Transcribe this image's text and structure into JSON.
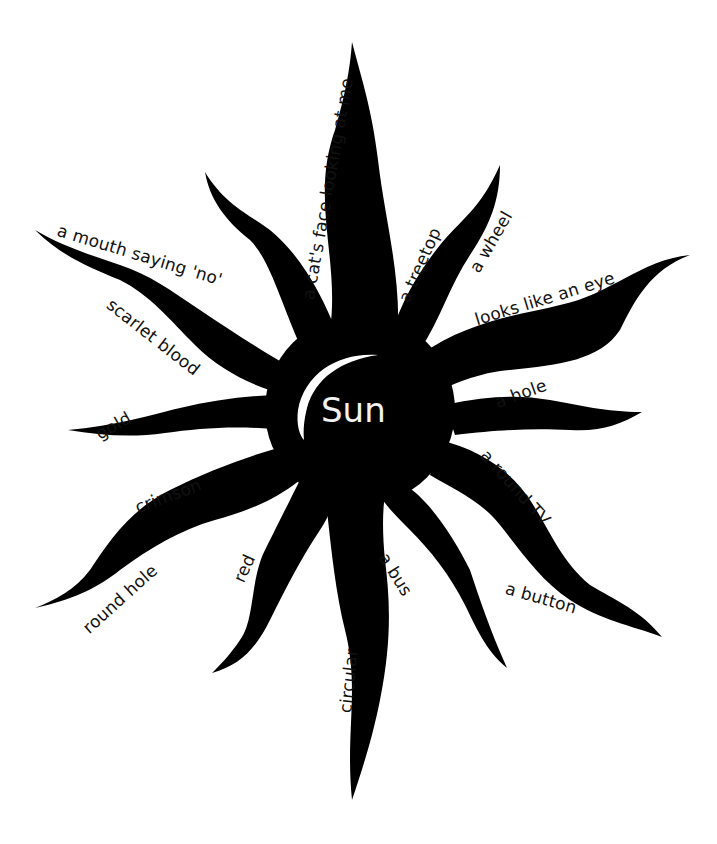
{
  "diagram": {
    "center": {
      "label": "Sun",
      "fill": "#000000",
      "text_color": "#f2f2f2"
    },
    "rays": [
      {
        "id": "top",
        "label": "a cat's face looking at me"
      },
      {
        "id": "upper-right-1",
        "label": "a treetop"
      },
      {
        "id": "upper-right-2",
        "label": "a wheel"
      },
      {
        "id": "right-1",
        "label": "looks like an eye"
      },
      {
        "id": "right-2",
        "label": "a hole"
      },
      {
        "id": "lower-right-1",
        "label": "a round TV"
      },
      {
        "id": "lower-right-2",
        "label": "a button"
      },
      {
        "id": "lower-right-3",
        "label": "a bus"
      },
      {
        "id": "bottom",
        "label": "circular"
      },
      {
        "id": "lower-left-1",
        "label": "red"
      },
      {
        "id": "lower-left-2",
        "label": "round hole"
      },
      {
        "id": "left-1",
        "label": "crimson"
      },
      {
        "id": "left-2",
        "label": "gold"
      },
      {
        "id": "upper-left-1",
        "label": "scarlet blood"
      },
      {
        "id": "upper-left-2",
        "label": "a mouth saying 'no'"
      }
    ]
  }
}
